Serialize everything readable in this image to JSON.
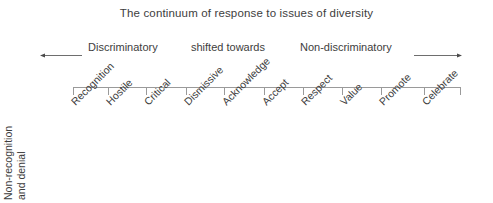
{
  "chart_data": {
    "type": "table",
    "title": "The continuum of response to issues of diversity",
    "xlabel": "",
    "ylabel": "Non-recognition and denial",
    "grid": false,
    "legend_position": "top",
    "categories": [
      "Recognition",
      "Hostile",
      "Critical",
      "Dismissive",
      "Acknowledge",
      "Accept",
      "Respect",
      "Value",
      "Promote",
      "Celebrate"
    ],
    "values": [
      1,
      2,
      3,
      4,
      5,
      6,
      7,
      8,
      9,
      10
    ],
    "annotations": [
      "Discriminatory",
      "shifted towards",
      "Non-discriminatory"
    ],
    "axis_range": [
      0,
      10
    ],
    "axis_direction": "left-to-right continuum from discriminatory to non-discriminatory"
  },
  "figure": {
    "title": "The continuum of response to issues of diversity",
    "background_color": "#ffffff",
    "text_color": "#3d3d3d",
    "line_color": "#9a9a9a"
  },
  "legend": {
    "left_label": "Discriminatory",
    "middle_label": "shifted towards",
    "right_label": "Non-discriminatory",
    "left_arrow_icon": "arrow-left-icon",
    "right_arrow_icon": "arrow-right-icon"
  },
  "axis": {
    "vertical_label_line1": "Non-recognition",
    "vertical_label_line2": "and denial",
    "ticks": [
      {
        "label": "Recognition",
        "x": 73
      },
      {
        "label": "Hostile",
        "x": 108
      },
      {
        "label": "Critical",
        "x": 146
      },
      {
        "label": "Dismissive",
        "x": 186
      },
      {
        "label": "Acknowledge",
        "x": 224
      },
      {
        "label": "Accept",
        "x": 264
      },
      {
        "label": "Respect",
        "x": 303
      },
      {
        "label": "Value",
        "x": 342
      },
      {
        "label": "Promote",
        "x": 381
      },
      {
        "label": "Celebrate",
        "x": 424
      },
      {
        "label": "",
        "x": 460
      }
    ]
  }
}
